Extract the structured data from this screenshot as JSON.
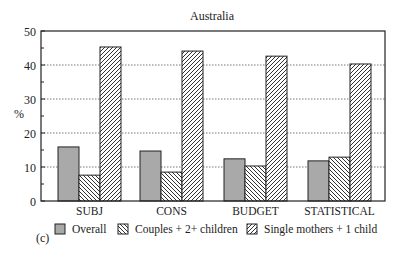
{
  "chart_data": {
    "type": "bar",
    "title": "Australia",
    "xlabel": "",
    "ylabel": "%",
    "ylim": [
      0,
      50
    ],
    "yticks": [
      0,
      10,
      20,
      30,
      40,
      50
    ],
    "grid": {
      "y": true,
      "style": "dotted"
    },
    "categories": [
      "SUBJ",
      "CONS",
      "BUDGET",
      "STATISTICAL"
    ],
    "series": [
      {
        "name": "Overall",
        "pattern": "solid-gray",
        "values": [
          15.9,
          14.7,
          12.4,
          11.8
        ]
      },
      {
        "name": "Couples + 2+ children",
        "pattern": "backslash-hatch",
        "values": [
          7.6,
          8.5,
          10.3,
          12.9
        ]
      },
      {
        "name": "Single mothers + 1 child",
        "pattern": "slash-hatch",
        "values": [
          45.3,
          44.1,
          42.6,
          40.3
        ]
      }
    ],
    "legend_position": "bottom",
    "panel_label": "(c)"
  },
  "colors": {
    "overall_fill": "#a9a9a9",
    "hatch": "#333333",
    "axis": "#222222",
    "grid": "#555555"
  }
}
